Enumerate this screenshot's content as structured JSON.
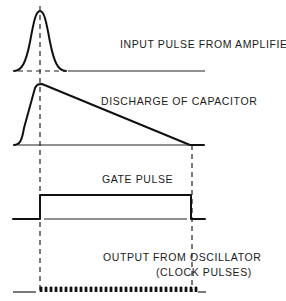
{
  "diagram": {
    "type": "timing-diagram",
    "traces": [
      {
        "id": "input",
        "label": "INPUT  PULSE FROM AMPLIFIER"
      },
      {
        "id": "capacitor",
        "label": "DISCHARGE OF CAPACITOR"
      },
      {
        "id": "gate",
        "label": "GATE  PULSE"
      },
      {
        "id": "clock",
        "label_line1": "OUTPUT FROM OSCILLATOR",
        "label_line2": "(CLOCK  PULSES)"
      }
    ],
    "markers": [
      "start-of-gate",
      "end-of-gate"
    ],
    "colors": {
      "line": "#111111",
      "background": "#ffffff"
    }
  }
}
